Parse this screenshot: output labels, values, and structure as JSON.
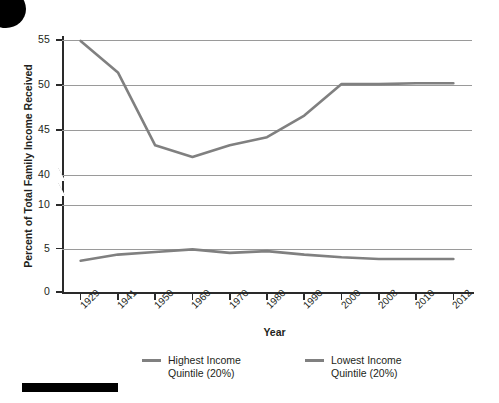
{
  "chart_data": {
    "type": "line",
    "title": "",
    "xlabel": "Year",
    "ylabel": "Percent of Total Family Income Received",
    "categories": [
      "1929",
      "1941",
      "1950",
      "1960",
      "1970",
      "1980",
      "1990",
      "2000",
      "2008",
      "2010",
      "2012"
    ],
    "yticks": [
      "0",
      "5",
      "10",
      "40",
      "45",
      "50",
      "55"
    ],
    "ylim": [
      0,
      55
    ],
    "axis_break": "between 10 and 40",
    "grid": true,
    "legend_position": "bottom",
    "series": [
      {
        "name": "Highest Income Quintile (20%)",
        "color": "#808080",
        "values": [
          54.9,
          51.4,
          43.3,
          42.0,
          43.3,
          44.2,
          46.6,
          50.1,
          50.1,
          50.2,
          50.2
        ]
      },
      {
        "name": "Lowest Income Quintile (20%)",
        "color": "#808080",
        "values": [
          3.6,
          4.3,
          4.6,
          4.9,
          4.5,
          4.7,
          4.3,
          4.0,
          3.8,
          3.8,
          3.8
        ]
      }
    ]
  },
  "axes": {
    "x_title": "Year",
    "y_title": "Percent of Total Family Income Received",
    "x_labels": [
      "1929",
      "1941",
      "1950",
      "1960",
      "1970",
      "1980",
      "1990",
      "2000",
      "2008",
      "2010",
      "2012"
    ],
    "y_labels": [
      "55",
      "50",
      "45",
      "40",
      "10",
      "5",
      "0"
    ]
  },
  "legend": {
    "items": [
      {
        "label": "Highest Income\nQuintile (20%)",
        "color": "#808080"
      },
      {
        "label": "Lowest Income\nQuintile (20%)",
        "color": "#808080"
      }
    ]
  },
  "colors": {
    "series_gray": "#808080",
    "axis": "#2a2a2a",
    "grid": "#9a9a9a",
    "text": "#231f20",
    "page_mark": "#000000"
  }
}
